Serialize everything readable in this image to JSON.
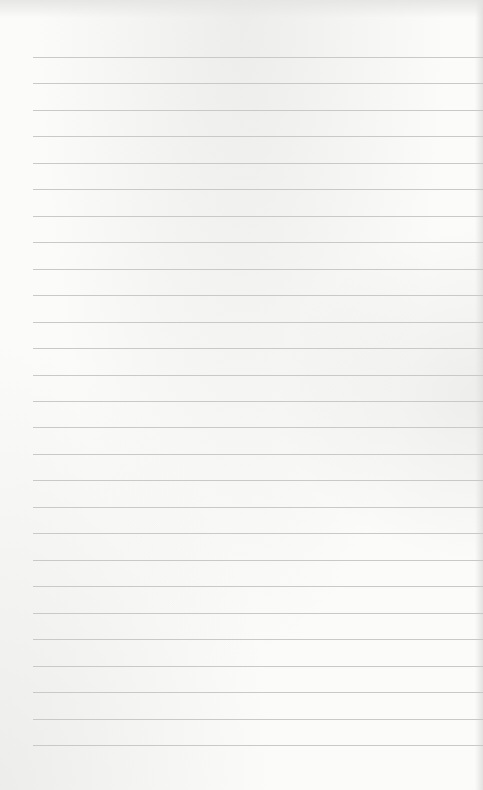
{
  "page": {
    "type": "blank lined paper",
    "background_color": "#fbfbfa",
    "line_color": "#c9c9c8",
    "line_count": 27,
    "first_line_y": 57,
    "line_spacing": 26.46,
    "line_left_margin": 33
  }
}
